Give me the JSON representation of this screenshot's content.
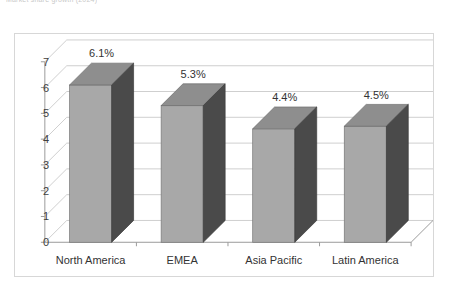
{
  "title": "Market share growth (2024)",
  "chart_data": {
    "type": "bar",
    "title": "Market share growth (2024)",
    "xlabel": "",
    "ylabel": "",
    "ylim": [
      0,
      7
    ],
    "yticks": [
      "0",
      "1",
      "2",
      "3",
      "4",
      "5",
      "6",
      "7"
    ],
    "grid": true,
    "legend": "none",
    "three_d": true,
    "categories": [
      "North America",
      "EMEA",
      "Asia Pacific",
      "Latin America"
    ],
    "values": [
      6.1,
      5.3,
      4.4,
      4.5
    ],
    "data_labels": [
      "6.1%",
      "5.3%",
      "4.4%",
      "4.5%"
    ],
    "colors": {
      "bar_front": "#a8a8a8",
      "bar_side": "#4a4a4a",
      "bar_top": "#8e8e8e",
      "gridline": "#cfcfcf",
      "axis": "#9a9a9a",
      "frame": "#d7d7d7",
      "text": "#333333",
      "background": "#ffffff"
    }
  }
}
